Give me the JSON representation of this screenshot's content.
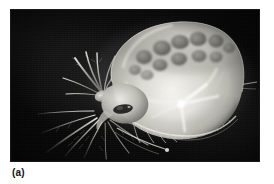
{
  "figure": {
    "caption_label": "(a)",
    "panel_background": "#ffffff",
    "photo": {
      "kind": "photomicrograph",
      "subject": "daphnia-water-flea",
      "palette": "grayscale",
      "background_color": "#0a0a0a",
      "highlight_color": "#f2f2ee",
      "midtone_color": "#9a9a95",
      "shadow_color": "#2c2c2a",
      "frame": {
        "x": 11,
        "y": 10,
        "width": 248,
        "height": 151
      },
      "features": [
        {
          "name": "carapace",
          "description": "large translucent bivalved shell occupying right two-thirds"
        },
        {
          "name": "brood-chamber-embryos",
          "description": "cluster of dark rounded embryos along upper dorsal carapace"
        },
        {
          "name": "compound-eye",
          "description": "dark eye spot at head near lower left of carapace"
        },
        {
          "name": "second-antennae",
          "description": "branched swimming antennae extending left and down from head"
        },
        {
          "name": "antennal-setae",
          "description": "long feathery bristles fanning toward lower left"
        },
        {
          "name": "thoracic-legs",
          "description": "filtering appendages under the ventral carapace margin"
        },
        {
          "name": "tail-spine",
          "description": "thin apical spine projecting to the right"
        },
        {
          "name": "ventral-carapace-margin",
          "description": "finely serrated bright edge along the lower shell"
        }
      ]
    }
  }
}
